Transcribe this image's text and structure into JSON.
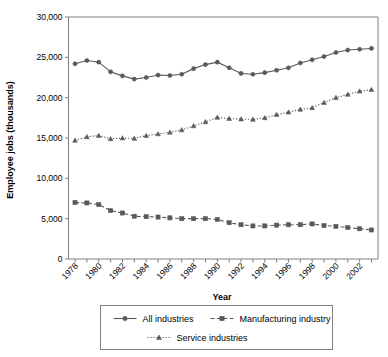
{
  "chart_data": {
    "type": "line",
    "title": "",
    "xlabel": "Year",
    "ylabel": "Employee jobs (thousands)",
    "xlim": [
      1978,
      2003
    ],
    "ylim": [
      0,
      30000
    ],
    "grid": false,
    "legend_position": "bottom",
    "x": [
      1978,
      1979,
      1980,
      1981,
      1982,
      1983,
      1984,
      1985,
      1986,
      1987,
      1988,
      1989,
      1990,
      1991,
      1992,
      1993,
      1994,
      1995,
      1996,
      1997,
      1998,
      1999,
      2000,
      2001,
      2002,
      2003
    ],
    "xtick_labels": [
      "1978",
      "1980",
      "1982",
      "1984",
      "1986",
      "1988",
      "1990",
      "1992",
      "1994",
      "1996",
      "1998",
      "2000",
      "2002"
    ],
    "ytick_labels": [
      "0",
      "5,000",
      "10,000",
      "15,000",
      "20,000",
      "25,000",
      "30,000"
    ],
    "ytick_values": [
      0,
      5000,
      10000,
      15000,
      20000,
      25000,
      30000
    ],
    "series": [
      {
        "name": "All industries",
        "marker": "diamond",
        "linestyle": "solid",
        "color": "#595959",
        "values": [
          24200,
          24600,
          24400,
          23200,
          22700,
          22300,
          22500,
          22800,
          22750,
          22900,
          23600,
          24100,
          24400,
          23700,
          23000,
          22900,
          23100,
          23400,
          23700,
          24300,
          24700,
          25100,
          25600,
          25900,
          26000,
          26100
        ]
      },
      {
        "name": "Manufacturing industry",
        "marker": "square",
        "linestyle": "dashed",
        "color": "#595959",
        "values": [
          7000,
          6950,
          6750,
          6000,
          5700,
          5300,
          5250,
          5200,
          5100,
          5000,
          5000,
          5000,
          4900,
          4500,
          4250,
          4100,
          4100,
          4200,
          4250,
          4250,
          4350,
          4150,
          4050,
          3900,
          3750,
          3600
        ]
      },
      {
        "name": "Service industries",
        "marker": "triangle",
        "linestyle": "dotted",
        "color": "#595959",
        "values": [
          14700,
          15150,
          15300,
          14900,
          15000,
          14950,
          15300,
          15500,
          15700,
          16000,
          16500,
          17000,
          17550,
          17400,
          17350,
          17300,
          17500,
          17900,
          18200,
          18550,
          18750,
          19400,
          20000,
          20400,
          20800,
          21000
        ]
      }
    ]
  },
  "legend": {
    "items": [
      {
        "label": "All industries"
      },
      {
        "label": "Manufacturing industry"
      },
      {
        "label": "Service industries"
      }
    ]
  },
  "colors": {
    "series": "#595959",
    "axis": "#808080",
    "text": "#000000",
    "background": "#ffffff"
  }
}
